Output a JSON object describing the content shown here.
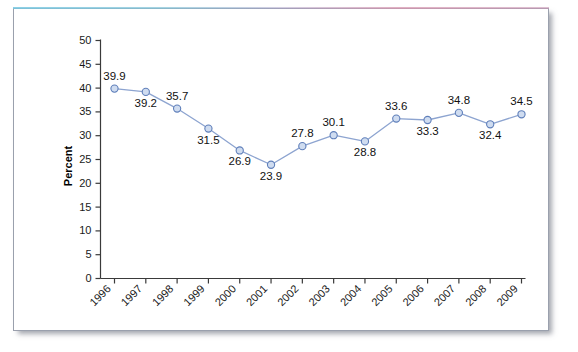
{
  "chart_data": {
    "type": "line",
    "title": "",
    "subtitle": "",
    "xlabel": "",
    "ylabel": "Percent",
    "categories": [
      "1996",
      "1997",
      "1998",
      "1999",
      "2000",
      "2001",
      "2002",
      "2003",
      "2004",
      "2005",
      "2006",
      "2007",
      "2008",
      "2009"
    ],
    "values": [
      39.9,
      39.2,
      35.7,
      31.5,
      26.9,
      23.9,
      27.8,
      30.1,
      28.8,
      33.6,
      33.3,
      34.8,
      32.4,
      34.5
    ],
    "data_labels": [
      "39.9",
      "39.2",
      "35.7",
      "31.5",
      "26.9",
      "23.9",
      "27.8",
      "30.1",
      "28.8",
      "33.6",
      "33.3",
      "34.8",
      "32.4",
      "34.5"
    ],
    "label_positions": [
      "above",
      "below",
      "above",
      "below",
      "below",
      "below",
      "above",
      "above",
      "below",
      "above",
      "below",
      "above",
      "below",
      "above"
    ],
    "ylim": [
      0,
      50
    ],
    "ytick_values": [
      0,
      5,
      10,
      15,
      20,
      25,
      30,
      35,
      40,
      45,
      50
    ],
    "ytick_labels": [
      "0",
      "5",
      "10",
      "15",
      "20",
      "25",
      "30",
      "35",
      "40",
      "45",
      "50"
    ],
    "grid": false,
    "legend": "none",
    "series_name": "Percent",
    "colors": {
      "line": "#8da4d0",
      "marker_fill": "#cfdcf0",
      "marker_stroke": "#5f7fba",
      "axis": "#3a3a3a",
      "text": "#111111",
      "card_border": "#9aa0ad",
      "background": "#ffffff"
    }
  }
}
